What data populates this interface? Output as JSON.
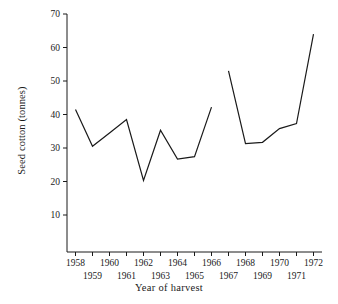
{
  "chart_data": {
    "type": "line",
    "title": "",
    "xlabel": "Year of harvest",
    "ylabel": "Seed cotton (tonnes)",
    "xlim": [
      1957.5,
      1972.5
    ],
    "ylim": [
      0,
      70
    ],
    "grid": false,
    "legend": "none",
    "x": [
      1958,
      1959,
      1960,
      1961,
      1962,
      1963,
      1964,
      1965,
      1966,
      1967,
      1968,
      1969,
      1970,
      1971,
      1972
    ],
    "values": [
      41.5,
      30.5,
      34.5,
      38.5,
      20.3,
      35.3,
      26.7,
      27.4,
      42.2,
      53.0,
      31.3,
      31.7,
      35.8,
      37.3,
      64.0
    ],
    "series": [
      {
        "name": "Seed cotton",
        "color": "#1a1a1a",
        "segments": [
          {
            "x": [
              1958,
              1959,
              1960,
              1961,
              1962,
              1963,
              1964,
              1965,
              1966
            ],
            "values": [
              41.5,
              30.5,
              34.5,
              38.5,
              20.3,
              35.3,
              26.7,
              27.4,
              42.2
            ]
          },
          {
            "x": [
              1967,
              1968,
              1969,
              1970,
              1971,
              1972
            ],
            "values": [
              53.0,
              31.3,
              31.7,
              35.8,
              37.3,
              64.0
            ]
          }
        ]
      }
    ],
    "break_between": [
      1966,
      1967
    ],
    "yticks": [
      10,
      20,
      30,
      40,
      50,
      60,
      70
    ],
    "ytick_labels": [
      "10",
      "20",
      "30",
      "40",
      "50",
      "60",
      "70"
    ],
    "xticks": [
      1958,
      1959,
      1960,
      1961,
      1962,
      1963,
      1964,
      1965,
      1966,
      1967,
      1968,
      1969,
      1970,
      1971,
      1972
    ],
    "xtick_labels": [
      "1958",
      "1959",
      "1960",
      "1961",
      "1962",
      "1963",
      "1964",
      "1965",
      "1966",
      "1967",
      "1968",
      "1969",
      "1970",
      "1971",
      "1972"
    ],
    "xtick_rows": [
      0,
      1,
      0,
      1,
      0,
      1,
      0,
      1,
      0,
      1,
      0,
      1,
      0,
      1,
      0
    ]
  },
  "axes": {
    "y_title": "Seed cotton (tonnes)",
    "x_title": "Year of harvest"
  }
}
